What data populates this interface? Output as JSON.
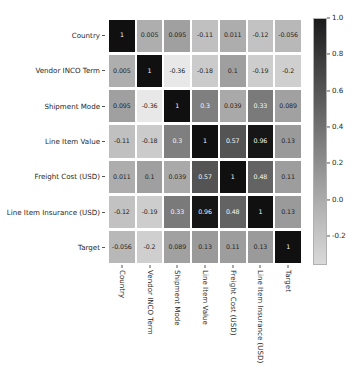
{
  "chart_data": {
    "type": "heatmap",
    "title": "",
    "xlabel": "",
    "ylabel": "",
    "grid": false,
    "legend_position": "right",
    "colormap": "gray_r",
    "categories": [
      "Country",
      "Vendor INCO Term",
      "Shipment Mode",
      "Line Item Value",
      "Freight Cost (USD)",
      "Line Item Insurance (USD)",
      "Target"
    ],
    "x_tick_labels": [
      "Country",
      "Vendor INCO Term",
      "Shipment Mode",
      "Line Item Value",
      "Freight Cost (USD)",
      "Line Item Insurance (USD)",
      "Target"
    ],
    "y_tick_labels": [
      "Country",
      "Vendor INCO Term",
      "Shipment Mode",
      "Line Item Value",
      "Freight Cost (USD)",
      "Line Item Insurance (USD)",
      "Target"
    ],
    "zlim": [
      -0.36,
      1.0
    ],
    "colorbar": {
      "ticks": [
        "1.0",
        "0.8",
        "0.6",
        "0.4",
        "0.2",
        "0.0",
        "-0.2"
      ],
      "tick_values": [
        1.0,
        0.8,
        0.6,
        0.4,
        0.2,
        0.0,
        -0.2
      ],
      "vmin": -0.36,
      "vmax": 1.0
    },
    "annotations": [
      [
        "1",
        "0.005",
        "0.095",
        "-0.11",
        "0.011",
        "-0.12",
        "-0.056"
      ],
      [
        "0.005",
        "1",
        "-0.36",
        "-0.18",
        "0.1",
        "-0.19",
        "-0.2"
      ],
      [
        "0.095",
        "-0.36",
        "1",
        "0.3",
        "0.039",
        "0.33",
        "0.089"
      ],
      [
        "-0.11",
        "-0.18",
        "0.3",
        "1",
        "0.57",
        "0.96",
        "0.13"
      ],
      [
        "0.011",
        "0.1",
        "0.039",
        "0.57",
        "1",
        "0.48",
        "0.11"
      ],
      [
        "-0.12",
        "-0.19",
        "0.33",
        "0.96",
        "0.48",
        "1",
        "0.13"
      ],
      [
        "-0.056",
        "-0.2",
        "0.089",
        "0.13",
        "0.11",
        "0.13",
        "1"
      ]
    ],
    "values": [
      [
        1,
        0.005,
        0.095,
        -0.11,
        0.011,
        -0.12,
        -0.056
      ],
      [
        0.005,
        1,
        -0.36,
        -0.18,
        0.1,
        -0.19,
        -0.2
      ],
      [
        0.095,
        -0.36,
        1,
        0.3,
        0.039,
        0.33,
        0.089
      ],
      [
        -0.11,
        -0.18,
        0.3,
        1,
        0.57,
        0.96,
        0.13
      ],
      [
        0.011,
        0.1,
        0.039,
        0.57,
        1,
        0.48,
        0.11
      ],
      [
        -0.12,
        -0.19,
        0.33,
        0.96,
        0.48,
        1,
        0.13
      ],
      [
        -0.056,
        -0.2,
        0.089,
        0.13,
        0.11,
        0.13,
        1
      ]
    ]
  },
  "colors": {
    "background": "#ffffff",
    "text": "#262626",
    "tick": "#555555",
    "cell_dark": "#1a1a1a",
    "cell_light": "#e6e6e6"
  }
}
